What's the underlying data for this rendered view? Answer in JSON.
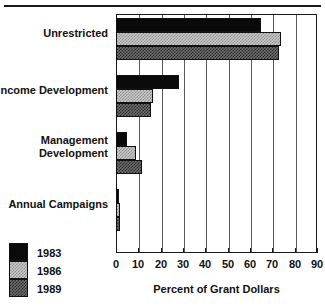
{
  "chart_data": {
    "type": "bar",
    "orientation": "horizontal",
    "title": "",
    "subtitle": "",
    "xlabel": "Percent of  Grant Dollars",
    "ylabel": "",
    "xlim": [
      0,
      90
    ],
    "xticks": [
      0,
      10,
      20,
      30,
      40,
      50,
      60,
      70,
      80,
      90
    ],
    "xtick_labels": [
      "0",
      "10",
      "20",
      "30",
      "40",
      "50",
      "60",
      "70",
      "80",
      "90"
    ],
    "grid": true,
    "grid_axis": "x",
    "legend_position": "bottom-left",
    "categories": [
      "Unrestricted",
      "Income Development",
      "Management Development",
      "Annual Campaigns"
    ],
    "category_lines": [
      [
        "Unrestricted"
      ],
      [
        "Income Development"
      ],
      [
        "Management",
        "Development"
      ],
      [
        "Annual Campaigns"
      ]
    ],
    "series": [
      {
        "name": "1983",
        "color": "#0a0a0a",
        "pattern": "solid-black",
        "values": [
          65,
          28,
          5,
          1.5
        ]
      },
      {
        "name": "1986",
        "color": "#c9c9c9",
        "pattern": "light-checker",
        "values": [
          74,
          16.5,
          9,
          2
        ]
      },
      {
        "name": "1989",
        "color": "#6e6e6e",
        "pattern": "dark-checker",
        "values": [
          73,
          15.5,
          11.5,
          2
        ]
      }
    ]
  },
  "legend": {
    "items": [
      {
        "label": "1983",
        "swatch": "y1983"
      },
      {
        "label": "1986",
        "swatch": "y1986"
      },
      {
        "label": "1989",
        "swatch": "y1989"
      }
    ]
  },
  "colors": {
    "axis": "#1a1a1a",
    "gridline": "#5a5a5a",
    "background": "#ffffff",
    "series_1983": "#0a0a0a",
    "series_1986": "#c9c9c9",
    "series_1989": "#6e6e6e"
  }
}
